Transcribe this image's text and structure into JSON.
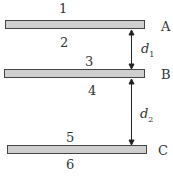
{
  "plates": [
    {
      "name": "A",
      "top_surface": "1",
      "bottom_surface": "2"
    },
    {
      "name": "B",
      "top_surface": "3",
      "bottom_surface": "4"
    },
    {
      "name": "C",
      "top_surface": "5",
      "bottom_surface": "6"
    }
  ],
  "distances": {
    "d1": "d",
    "d1_sub": "1",
    "d2": "d",
    "d2_sub": "2"
  }
}
